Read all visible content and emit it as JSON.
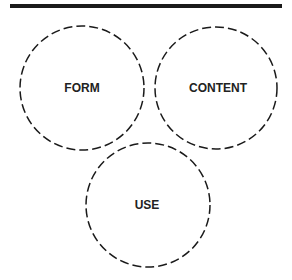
{
  "diagram": {
    "type": "venn-like-circles",
    "top_rule": {
      "x1": 10,
      "x2": 282,
      "y": 6,
      "thickness": 4,
      "color": "#1a1a1a"
    },
    "circles": [
      {
        "label": "FORM",
        "cx": 82,
        "cy": 88,
        "r": 62
      },
      {
        "label": "CONTENT",
        "cx": 216,
        "cy": 88,
        "r": 61
      },
      {
        "label": "USE",
        "cx": 148,
        "cy": 205,
        "r": 62
      }
    ],
    "stroke_color": "#1a1a1a",
    "stroke_style": "dashed"
  }
}
